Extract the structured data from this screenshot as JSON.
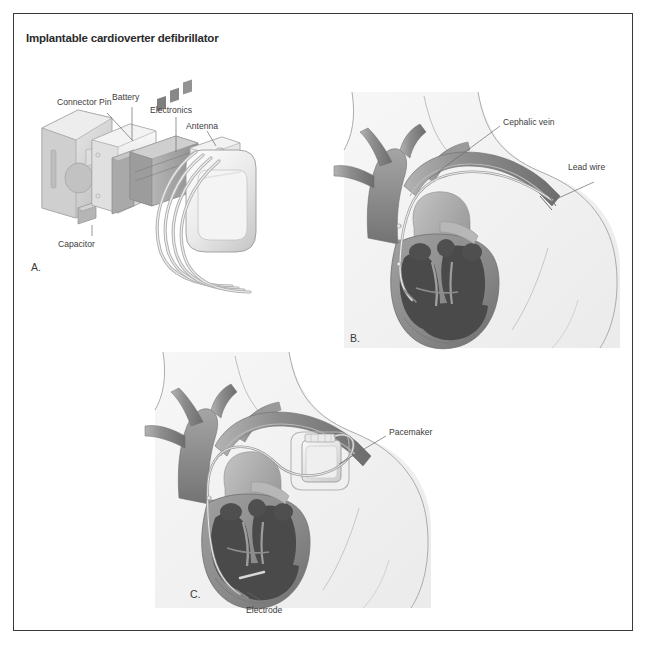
{
  "figure": {
    "title": "Implantable cardioverter defibrillator",
    "border_color": "#3a3a3a",
    "background_color": "#ffffff"
  },
  "panels": [
    {
      "id": "a",
      "letter": "A.",
      "description": "Exploded view of implantable cardioverter defibrillator device components",
      "labels": [
        {
          "name": "connector-pin",
          "text": "Connector Pin"
        },
        {
          "name": "battery",
          "text": "Battery"
        },
        {
          "name": "electronics",
          "text": "Electronics"
        },
        {
          "name": "antenna",
          "text": "Antenna"
        },
        {
          "name": "capacitor",
          "text": "Capacitor"
        }
      ]
    },
    {
      "id": "b",
      "letter": "B.",
      "description": "Lead wire threaded through the cephalic vein into the heart",
      "labels": [
        {
          "name": "cephalic-vein",
          "text": "Cephalic vein"
        },
        {
          "name": "lead-wire",
          "text": "Lead wire"
        }
      ]
    },
    {
      "id": "c",
      "letter": "C.",
      "description": "Implanted pacemaker in chest with electrode in right ventricle",
      "labels": [
        {
          "name": "pacemaker",
          "text": "Pacemaker"
        },
        {
          "name": "electrode",
          "text": "Electrode"
        }
      ]
    }
  ],
  "colors": {
    "title_text": "#2b2b2b",
    "label_text": "#3c3c3c",
    "leader_line": "#6a6a6a",
    "body_silhouette": "#f2f2f2",
    "body_outline": "#9a9a9a",
    "vessel": "#8e8e8e",
    "vessel_dark": "#6f6f6f",
    "myocardium": "#8c8c8c",
    "chamber": "#4a4a4a",
    "device_shell": "#e3e3e3",
    "device_outline": "#9b9b9b",
    "lead": "#d8d8d8"
  }
}
